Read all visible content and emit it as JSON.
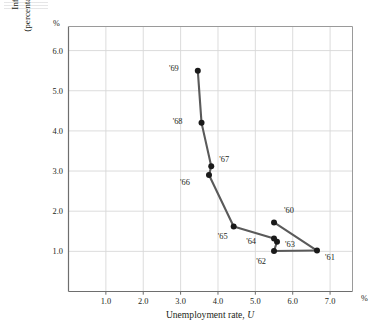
{
  "chart_data": {
    "type": "line",
    "title": "",
    "xlabel": "Unemployment rate, U",
    "ylabel_line1": "Inflation rate",
    "ylabel_line2": "(percentage change in P)",
    "x_unit_symbol": "%",
    "y_unit_symbol": "%",
    "xlim": [
      0.0,
      7.6
    ],
    "ylim": [
      0.0,
      6.6
    ],
    "grid": true,
    "legend": "none",
    "xticks": [
      "1.0",
      "2.0",
      "3.0",
      "4.0",
      "5.0",
      "6.0",
      "7.0"
    ],
    "xtick_values": [
      1.0,
      2.0,
      3.0,
      4.0,
      5.0,
      6.0,
      7.0
    ],
    "yticks": [
      "1.0",
      "2.0",
      "3.0",
      "4.0",
      "5.0",
      "6.0"
    ],
    "ytick_values": [
      1.0,
      2.0,
      3.0,
      4.0,
      5.0,
      6.0
    ],
    "series_name": "Phillips curve 1960-1969",
    "marker_color": "#1a1a1a",
    "line_color": "#5a5a5a",
    "points": [
      {
        "label": "'60",
        "x": 5.5,
        "y": 1.72,
        "label_dx": 10,
        "label_dy": -9
      },
      {
        "label": "'61",
        "x": 6.65,
        "y": 1.02,
        "label_dx": 8,
        "label_dy": 9
      },
      {
        "label": "'62",
        "x": 5.5,
        "y": 1.01,
        "label_dx": -8,
        "label_dy": 13
      },
      {
        "label": "'63",
        "x": 5.58,
        "y": 1.24,
        "label_dx": 8,
        "label_dy": 5
      },
      {
        "label": "'64",
        "x": 5.5,
        "y": 1.32,
        "label_dx": -18,
        "label_dy": 5
      },
      {
        "label": "'65",
        "x": 4.42,
        "y": 1.62,
        "label_dx": -6,
        "label_dy": 13
      },
      {
        "label": "'66",
        "x": 3.76,
        "y": 2.9,
        "label_dx": -19,
        "label_dy": 10
      },
      {
        "label": "'67",
        "x": 3.82,
        "y": 3.12,
        "label_dx": 8,
        "label_dy": -4
      },
      {
        "label": "'68",
        "x": 3.56,
        "y": 4.2,
        "label_dx": -19,
        "label_dy": 1
      },
      {
        "label": "'69",
        "x": 3.46,
        "y": 5.5,
        "label_dx": -19,
        "label_dy": 0
      }
    ],
    "path_order": [
      "'69",
      "'68",
      "'67",
      "'66",
      "'65",
      "'64",
      "'63",
      "'62",
      "'61",
      "'60"
    ],
    "path_segments": [
      [
        "'69",
        "'68"
      ],
      [
        "'68",
        "'67"
      ],
      [
        "'67",
        "'66"
      ],
      [
        "'66",
        "'65"
      ],
      [
        "'65",
        "'64"
      ],
      [
        "'64",
        "'63"
      ],
      [
        "'63",
        "'62"
      ],
      [
        "'62",
        "'61"
      ],
      [
        "'61",
        "'60"
      ]
    ]
  }
}
